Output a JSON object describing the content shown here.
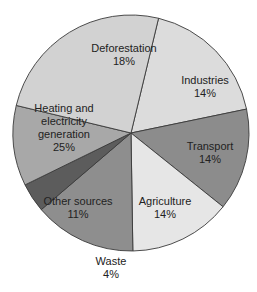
{
  "chart_data": {
    "type": "pie",
    "title": "",
    "unit": "%",
    "slices": [
      {
        "label": "Deforestation",
        "value": 18,
        "color": "#dcdcdc",
        "label_lines": [
          "Deforestation",
          "18%"
        ],
        "lx": 124,
        "ly": 52
      },
      {
        "label": "Industries",
        "value": 14,
        "color": "#8c8c8c",
        "label_lines": [
          "Industries",
          "14%"
        ],
        "lx": 205,
        "ly": 84
      },
      {
        "label": "Transport",
        "value": 14,
        "color": "#e6e6e6",
        "label_lines": [
          "Transport",
          "14%"
        ],
        "lx": 210,
        "ly": 150
      },
      {
        "label": "Agriculture",
        "value": 14,
        "color": "#8e8e8e",
        "label_lines": [
          "Agriculture",
          "14%"
        ],
        "lx": 165,
        "ly": 205
      },
      {
        "label": "Waste",
        "value": 4,
        "color": "#5c5c5c",
        "label_lines": [
          "Waste",
          "4%"
        ],
        "lx": 111,
        "ly": 265,
        "outside": true
      },
      {
        "label": "Other sources",
        "value": 11,
        "color": "#a8a8a8",
        "label_lines": [
          "Other sources",
          "11%"
        ],
        "lx": 78,
        "ly": 205
      },
      {
        "label": "Heating and electricity generation",
        "value": 25,
        "color": "#d2d2d2",
        "label_lines": [
          "Heating and",
          "electricity",
          "generation",
          "25%"
        ],
        "lx": 64,
        "ly": 112
      }
    ],
    "start_angle_deg": -76.5,
    "legend": "none",
    "labels_inside": true
  }
}
